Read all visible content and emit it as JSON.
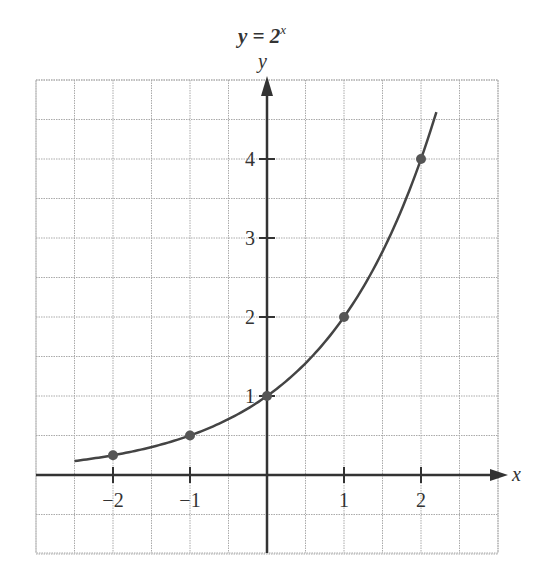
{
  "chart_data": {
    "type": "line",
    "title_main": "y = 2",
    "title_exp": "x",
    "xlabel": "x",
    "ylabel": "y",
    "xlim": [
      -3,
      3
    ],
    "ylim": [
      -1,
      5
    ],
    "grid": true,
    "grid_step": 0.5,
    "x_ticks": [
      -2,
      -1,
      1,
      2
    ],
    "x_tick_labels": [
      "−2",
      "−1",
      "1",
      "2"
    ],
    "y_ticks": [
      1,
      2,
      3,
      4
    ],
    "y_tick_labels": [
      "1",
      "2",
      "3",
      "4"
    ],
    "series": [
      {
        "name": "y = 2^x",
        "function": "2^x",
        "domain": [
          -2.5,
          2.2
        ],
        "points": [
          {
            "x": -2,
            "y": 0.25
          },
          {
            "x": -1,
            "y": 0.5
          },
          {
            "x": 0,
            "y": 1
          },
          {
            "x": 1,
            "y": 2
          },
          {
            "x": 2,
            "y": 4
          }
        ]
      }
    ],
    "colors": {
      "curve": "#444444",
      "axis": "#333333",
      "grid": "#aaaaaa",
      "point": "#555555"
    }
  }
}
